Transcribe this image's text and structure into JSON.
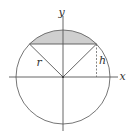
{
  "diagram": {
    "labels": {
      "x_axis": "x",
      "y_axis": "y",
      "radius": "r",
      "height": "h"
    },
    "colors": {
      "stroke": "#555555",
      "shade": "#cfcfcf",
      "background": "#ffffff"
    },
    "geometry": {
      "center": [
        63,
        77
      ],
      "radius": 47,
      "chord_y": 44,
      "chord_left_x": 29.5,
      "chord_right_x": 96.5
    }
  }
}
